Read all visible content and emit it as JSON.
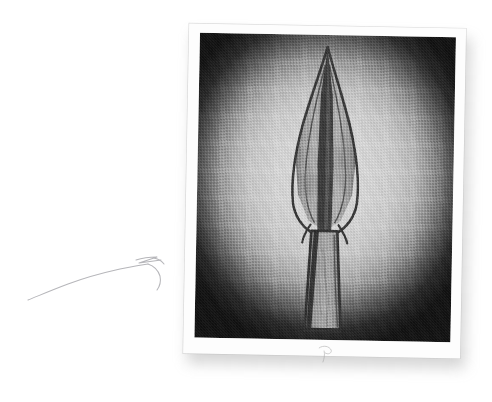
{
  "page": {
    "background_color": "#ffffff",
    "width": 492,
    "height": 402,
    "content_type": "scanned-book-page-with-photograph"
  },
  "annotation": {
    "name": "hand-drawn-arrow",
    "description": "faint hand drawn arrow curving from lower left upward to the right, pointing toward the photograph",
    "stroke_color": "#b9b9bd",
    "stroke_width": 1,
    "start_point": [
      30,
      298
    ],
    "end_point": [
      168,
      262
    ],
    "arrowhead_style": "open-zigzag"
  },
  "photograph": {
    "name": "artifact-photograph",
    "rotation_degrees": 1.05,
    "paper_color": "#fdfdfd",
    "border_width_px": 10,
    "shadow_color": "#787878",
    "frame": {
      "vignette": true,
      "vignette_center_color": "#d8d8d8",
      "vignette_corner_color": "#101010",
      "halftone_screen": true,
      "background_color": "#c2c2c2"
    },
    "subject": {
      "name": "spearhead-artifact",
      "description": "leaf-shaped metal spearhead with long tapering socket, photographed against a plain backdrop",
      "outline_color": "#2a2a2a",
      "blade_fill_color": "#9a9a9a",
      "socket_fill_color": "#8d8d8d",
      "tip_point": [
        138,
        22
      ],
      "blade_widest_y": 150,
      "socket_bottom_y": 300
    },
    "border_mark": {
      "name": "pencil-mark",
      "description": "faint pencil squiggle on the lower white border of the photograph",
      "color": "#9a9a9a"
    }
  }
}
